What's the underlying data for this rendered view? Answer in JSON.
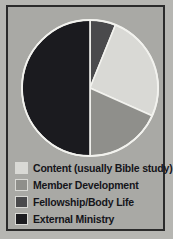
{
  "chart_data": {
    "type": "pie",
    "title": "",
    "categories": [
      "Content (usually Bible study)",
      "Member Development",
      "Fellowship/Body Life",
      "External Ministry"
    ],
    "values": [
      25.6,
      18.3,
      6.1,
      50.0
    ],
    "angles_deg": [
      92,
      66,
      22,
      180
    ],
    "colors": [
      "#d9d9d5",
      "#8f8f8b",
      "#4a4a4c",
      "#1b1b1f"
    ],
    "start_angle_deg": 0,
    "direction": "clockwise",
    "slice_order": [
      "Fellowship/Body Life",
      "Content (usually Bible study)",
      "Member Development",
      "External Ministry"
    ],
    "legend_position": "bottom-left",
    "grid": false,
    "xlabel": "",
    "ylabel": ""
  },
  "figure": {
    "background_color": "#b6b6b2",
    "panel_color": "#a9a9a5",
    "border_color": "#2b2b2b",
    "slice_outline_color": "#f2f2ee"
  },
  "legend": {
    "items": [
      {
        "label": "Content (usually Bible study)",
        "color": "#d9d9d5"
      },
      {
        "label": "Member Development",
        "color": "#8f8f8b"
      },
      {
        "label": "Fellowship/Body Life",
        "color": "#4a4a4c"
      },
      {
        "label": "External Ministry",
        "color": "#1b1b1f"
      }
    ]
  }
}
